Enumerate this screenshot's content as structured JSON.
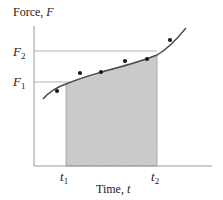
{
  "figure": {
    "y_axis_label": "Force, ",
    "y_axis_var": "F",
    "x_axis_label": "Time, ",
    "x_axis_var": "t",
    "y_ticks": [
      {
        "sym": "F",
        "sub": "2"
      },
      {
        "sym": "F",
        "sub": "1"
      }
    ],
    "x_ticks": [
      {
        "sym": "t",
        "sub": "1"
      },
      {
        "sym": "t",
        "sub": "2"
      }
    ],
    "colors": {
      "axis": "#9a9a9a",
      "curve": "#4a4a4a",
      "shade": "#c9c9c9",
      "points": "#1a1a1a",
      "guide": "#b5b5b5"
    }
  }
}
